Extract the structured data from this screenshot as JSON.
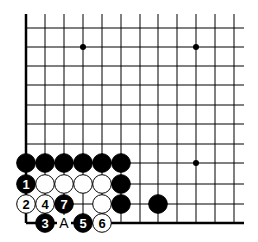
{
  "diagram": {
    "type": "go-board-fragment",
    "grid": {
      "x_lines": [
        26,
        45,
        64,
        83,
        102,
        121,
        140,
        158,
        177,
        196,
        215,
        234
      ],
      "y_lines": [
        28,
        47,
        66,
        85,
        105,
        124,
        144,
        163,
        184,
        204,
        223
      ],
      "line_right_end": 244,
      "line_top_end": 14,
      "line_color": "#000000"
    },
    "star_points": [
      [
        83,
        47
      ],
      [
        196,
        47
      ],
      [
        196,
        163
      ]
    ],
    "stones": [
      {
        "x": 26,
        "y": 163,
        "color": "black",
        "label": ""
      },
      {
        "x": 45,
        "y": 163,
        "color": "black",
        "label": ""
      },
      {
        "x": 64,
        "y": 163,
        "color": "black",
        "label": ""
      },
      {
        "x": 83,
        "y": 163,
        "color": "black",
        "label": ""
      },
      {
        "x": 102,
        "y": 163,
        "color": "black",
        "label": ""
      },
      {
        "x": 121,
        "y": 163,
        "color": "black",
        "label": ""
      },
      {
        "x": 26,
        "y": 184,
        "color": "black",
        "label": "1"
      },
      {
        "x": 45,
        "y": 184,
        "color": "white",
        "label": ""
      },
      {
        "x": 64,
        "y": 184,
        "color": "white",
        "label": ""
      },
      {
        "x": 83,
        "y": 184,
        "color": "white",
        "label": ""
      },
      {
        "x": 102,
        "y": 184,
        "color": "white",
        "label": ""
      },
      {
        "x": 121,
        "y": 184,
        "color": "black",
        "label": ""
      },
      {
        "x": 26,
        "y": 204,
        "color": "white",
        "label": "2"
      },
      {
        "x": 45,
        "y": 204,
        "color": "white",
        "label": "4"
      },
      {
        "x": 64,
        "y": 204,
        "color": "black",
        "label": "7"
      },
      {
        "x": 102,
        "y": 204,
        "color": "white",
        "label": ""
      },
      {
        "x": 121,
        "y": 204,
        "color": "black",
        "label": ""
      },
      {
        "x": 158,
        "y": 204,
        "color": "black",
        "label": ""
      },
      {
        "x": 45,
        "y": 223,
        "color": "black",
        "label": "3"
      },
      {
        "x": 83,
        "y": 223,
        "color": "black",
        "label": "5"
      },
      {
        "x": 102,
        "y": 223,
        "color": "white",
        "label": "6"
      }
    ],
    "markers": [
      {
        "x": 64,
        "y": 223,
        "text": "A"
      }
    ]
  }
}
